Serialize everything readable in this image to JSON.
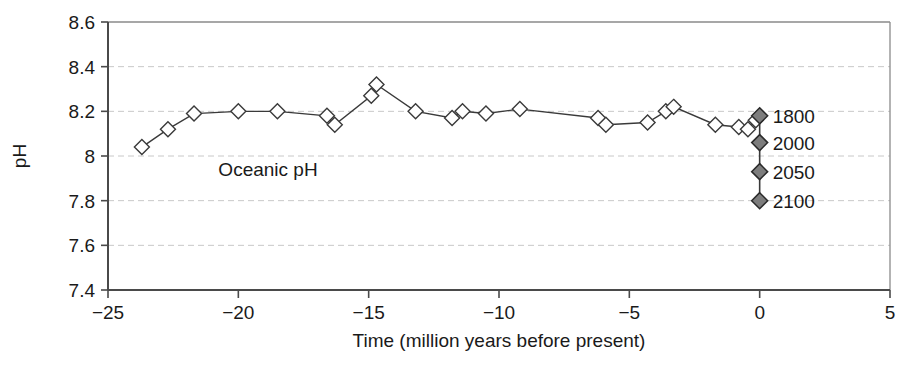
{
  "chart_data": {
    "type": "line",
    "title": "",
    "annotation": "Oceanic pH",
    "xlabel": "Time (million years before present)",
    "ylabel": "pH",
    "xlim": [
      -25,
      5
    ],
    "ylim": [
      7.4,
      8.6
    ],
    "xticks": [
      -25,
      -20,
      -15,
      -10,
      -5,
      0,
      5
    ],
    "xticklabels": [
      "−25",
      "−20",
      "−15",
      "−10",
      "−5",
      "0",
      "5"
    ],
    "yticks": [
      7.4,
      7.6,
      7.8,
      8,
      8.2,
      8.4,
      8.6
    ],
    "yticklabels": [
      "7.4",
      "7.6",
      "7.8",
      "8",
      "8.2",
      "8.4",
      "8.6"
    ],
    "grid": "horizontal-dashed",
    "legend": "none",
    "series": [
      {
        "name": "Oceanic pH proxy record",
        "marker": "open-diamond",
        "marker_fill": "#ffffff",
        "marker_edge": "#3a3a3a",
        "line_color": "#3a3a3a",
        "x": [
          -23.7,
          -22.7,
          -21.7,
          -20.0,
          -18.5,
          -16.6,
          -16.3,
          -14.9,
          -14.7,
          -13.2,
          -11.8,
          -11.4,
          -10.5,
          -9.2,
          -6.2,
          -5.9,
          -4.3,
          -3.6,
          -3.3,
          -1.7,
          -0.8,
          -0.45,
          -0.15
        ],
        "y": [
          8.04,
          8.12,
          8.19,
          8.2,
          8.2,
          8.18,
          8.14,
          8.27,
          8.32,
          8.2,
          8.17,
          8.2,
          8.19,
          8.21,
          8.17,
          8.14,
          8.15,
          8.2,
          8.22,
          8.14,
          8.13,
          8.12,
          8.16
        ]
      },
      {
        "name": "Projections",
        "marker": "filled-diamond",
        "marker_fill": "#7d7d7d",
        "marker_edge": "#2a2a2a",
        "line_color": "#3a3a3a",
        "x": [
          0,
          0,
          0,
          0
        ],
        "y": [
          8.18,
          8.06,
          7.93,
          7.8
        ],
        "point_labels": [
          "1800",
          "2000",
          "2050",
          "2100"
        ]
      }
    ]
  },
  "colors": {
    "axis": "#4a4a4a",
    "grid": "#c8c8c8",
    "line": "#3a3a3a",
    "projection_fill": "#7d7d7d",
    "text": "#1a1a1a",
    "background": "#ffffff"
  }
}
